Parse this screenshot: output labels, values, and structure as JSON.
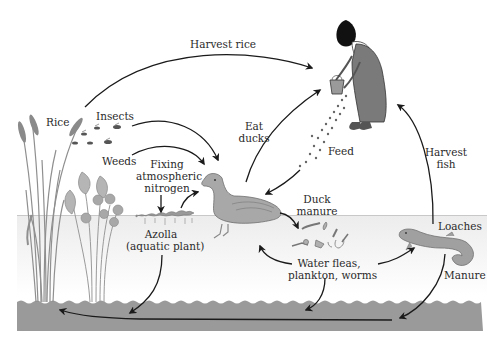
{
  "diagram": {
    "colors": {
      "water": "#f0f0f0",
      "water_line": "#c8c8c8",
      "soil": "#9a9a9a",
      "arrow": "#1a1a1a",
      "plant": "#9c9c9c",
      "duck": "#a8a8a8",
      "loach": "#a0a0a0",
      "dress": "#7a7a7a"
    },
    "labels": {
      "harvest_rice": "Harvest rice",
      "rice": "Rice",
      "insects": "Insects",
      "weeds": "Weeds",
      "fixing_1": "Fixing",
      "fixing_2": "atmospheric",
      "fixing_3": "nitrogen",
      "azolla_1": "Azolla",
      "azolla_2": "(aquatic plant)",
      "eat_1": "Eat",
      "eat_2": "ducks",
      "feed": "Feed",
      "harvest_fish_1": "Harvest",
      "harvest_fish_2": "fish",
      "duck_manure_1": "Duck",
      "duck_manure_2": "manure",
      "loaches": "Loaches",
      "fleas_1": "Water fleas,",
      "fleas_2": "plankton, worms",
      "manure": "Manure"
    },
    "nodes": [
      {
        "id": "farmer",
        "label": "Farmer"
      },
      {
        "id": "rice",
        "label": "Rice"
      },
      {
        "id": "insects",
        "label": "Insects"
      },
      {
        "id": "weeds",
        "label": "Weeds"
      },
      {
        "id": "azolla",
        "label": "Azolla (aquatic plant)"
      },
      {
        "id": "duck",
        "label": "Duck"
      },
      {
        "id": "invertebrates",
        "label": "Water fleas, plankton, worms"
      },
      {
        "id": "loaches",
        "label": "Loaches"
      },
      {
        "id": "soil",
        "label": "Soil"
      }
    ],
    "edges": [
      {
        "from": "rice",
        "to": "farmer",
        "label": "Harvest rice"
      },
      {
        "from": "insects",
        "to": "duck",
        "label": ""
      },
      {
        "from": "weeds",
        "to": "duck",
        "label": ""
      },
      {
        "from": "azolla",
        "to": "duck",
        "label": ""
      },
      {
        "from": "atmosphere",
        "to": "azolla",
        "label": "Fixing atmospheric nitrogen"
      },
      {
        "from": "duck",
        "to": "farmer",
        "label": "Eat ducks"
      },
      {
        "from": "farmer",
        "to": "duck",
        "label": "Feed"
      },
      {
        "from": "duck",
        "to": "invertebrates",
        "label": "Duck manure"
      },
      {
        "from": "invertebrates",
        "to": "duck",
        "label": ""
      },
      {
        "from": "invertebrates",
        "to": "loaches",
        "label": ""
      },
      {
        "from": "loaches",
        "to": "farmer",
        "label": "Harvest fish"
      },
      {
        "from": "loaches",
        "to": "soil",
        "label": "Manure"
      },
      {
        "from": "azolla",
        "to": "soil",
        "label": ""
      },
      {
        "from": "invertebrates",
        "to": "soil",
        "label": ""
      },
      {
        "from": "soil",
        "to": "rice",
        "label": ""
      }
    ]
  }
}
